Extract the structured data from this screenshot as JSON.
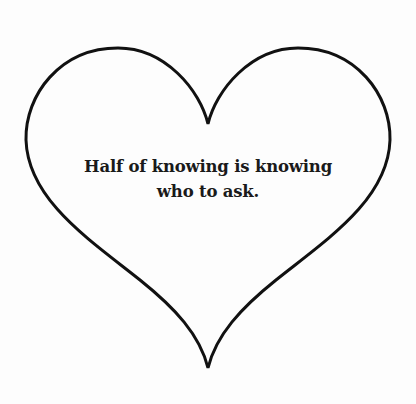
{
  "card": {
    "shape": "heart",
    "stroke_color": "#111111",
    "background_color": "#fdfdfd",
    "quote": {
      "line1": "Half of knowing is knowing",
      "line2": "who to ask."
    }
  }
}
